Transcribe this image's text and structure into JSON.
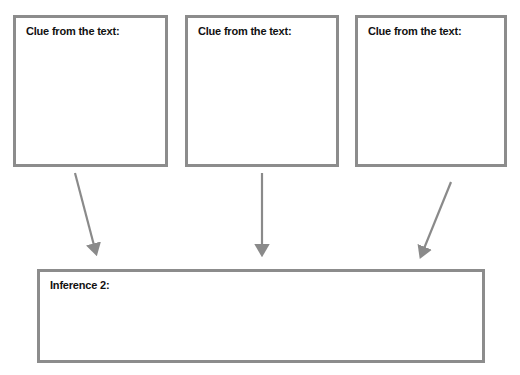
{
  "diagram": {
    "clue_boxes": [
      {
        "label": "Clue from the text:",
        "x": 13,
        "y": 15,
        "w": 155,
        "h": 152
      },
      {
        "label": "Clue from the text:",
        "x": 185,
        "y": 15,
        "w": 154,
        "h": 152
      },
      {
        "label": "Clue from the text:",
        "x": 355,
        "y": 15,
        "w": 152,
        "h": 152
      }
    ],
    "inference_box": {
      "label": "Inference 2:",
      "x": 37,
      "y": 269,
      "w": 448,
      "h": 94
    },
    "arrows": [
      {
        "from": [
          75,
          173
        ],
        "to": [
          98,
          262
        ]
      },
      {
        "from": [
          262,
          173
        ],
        "to": [
          262,
          262
        ]
      },
      {
        "from": [
          451,
          182
        ],
        "to": [
          418,
          264
        ]
      }
    ],
    "colors": {
      "border": "#8c8c8c",
      "arrow": "#8a8a8a",
      "text": "#111111"
    }
  }
}
